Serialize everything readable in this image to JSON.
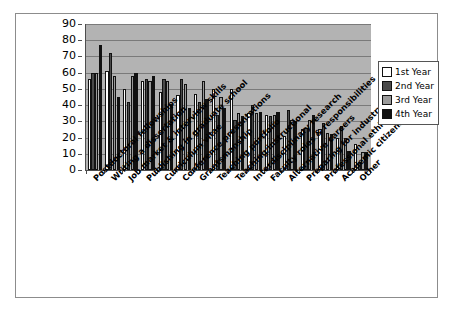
{
  "chart_data": {
    "type": "bar",
    "title": "",
    "xlabel": "",
    "ylabel": "",
    "ylim": [
      0,
      90
    ],
    "ytick_step": 10,
    "yticks": [
      0,
      10,
      20,
      30,
      40,
      50,
      60,
      70,
      80,
      90
    ],
    "grid": true,
    "legend_position": "right",
    "plot_background": "#b3b3b3",
    "categories": [
      "Postdoctoral fellowships",
      "Writing a dissertation",
      "Job market & interview skills",
      "Publishing in graduate school",
      "Curriculum vitae",
      "Conference presentations",
      "Grantsmanship",
      "Teaching portfolio",
      "Teaching/instructional",
      "Interdisciplinary research",
      "Faculty roles & responsibilities",
      "Alternative careers",
      "Preparing for industry",
      "Professional ethics",
      "Academic citizenship",
      "Other"
    ],
    "series": [
      {
        "name": "1st Year",
        "color": "#ffffff",
        "values": [
          56,
          61,
          50,
          55,
          48,
          46,
          47,
          50,
          50,
          35,
          34,
          21,
          25,
          25,
          20,
          16
        ]
      },
      {
        "name": "2nd Year",
        "color": "#4a4a4a",
        "values": [
          60,
          72,
          42,
          56,
          56,
          56,
          42,
          34,
          31,
          40,
          33,
          37,
          26,
          29,
          27,
          5
        ]
      },
      {
        "name": "3rd Year",
        "color": "#9a9a9a",
        "values": [
          60,
          58,
          58,
          55,
          55,
          53,
          55,
          45,
          35,
          35,
          34,
          31,
          31,
          23,
          20,
          11
        ]
      },
      {
        "name": "4th Year",
        "color": "#111111",
        "values": [
          77,
          45,
          60,
          58,
          41,
          38,
          44,
          38,
          33,
          36,
          36,
          30,
          34,
          22,
          12,
          11
        ]
      }
    ]
  },
  "legend": {
    "items": [
      {
        "label": "1st Year",
        "class": "y1"
      },
      {
        "label": "2nd Year",
        "class": "y2"
      },
      {
        "label": "3rd Year",
        "class": "y3"
      },
      {
        "label": "4th Year",
        "class": "y4"
      }
    ]
  }
}
